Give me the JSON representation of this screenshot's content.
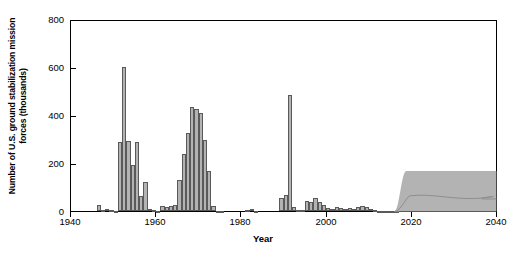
{
  "chart_data": {
    "type": "bar",
    "title": "",
    "xlabel": "Year",
    "ylabel": "Number of U.S. ground stabilization mission forces (thousands)",
    "xlim": [
      1940,
      2040
    ],
    "ylim": [
      0,
      800
    ],
    "xticks": [
      1940,
      1960,
      1980,
      2000,
      2020,
      2040
    ],
    "yticks": [
      0,
      200,
      400,
      600,
      800
    ],
    "grid": false,
    "legend": "none",
    "bar_color": "#b3b3b3",
    "bar_edge_color": "#5a5a5a",
    "band_color": "#b3b3b3",
    "categories": [
      1940,
      1941,
      1942,
      1943,
      1944,
      1945,
      1946,
      1947,
      1948,
      1949,
      1950,
      1951,
      1952,
      1953,
      1954,
      1955,
      1956,
      1957,
      1958,
      1959,
      1960,
      1961,
      1962,
      1963,
      1964,
      1965,
      1966,
      1967,
      1968,
      1969,
      1970,
      1971,
      1972,
      1973,
      1974,
      1975,
      1976,
      1977,
      1978,
      1979,
      1980,
      1981,
      1982,
      1983,
      1984,
      1985,
      1986,
      1987,
      1988,
      1989,
      1990,
      1991,
      1992,
      1993,
      1994,
      1995,
      1996,
      1997,
      1998,
      1999,
      2000,
      2001,
      2002,
      2003,
      2004,
      2005,
      2006,
      2007,
      2008,
      2009,
      2010,
      2011,
      2012,
      2013,
      2014,
      2015,
      2016
    ],
    "values": [
      0,
      0,
      0,
      0,
      0,
      0,
      28,
      6,
      9,
      4,
      2,
      290,
      605,
      295,
      195,
      290,
      65,
      125,
      10,
      6,
      3,
      22,
      20,
      22,
      25,
      130,
      240,
      330,
      440,
      430,
      415,
      300,
      170,
      22,
      3,
      2,
      0,
      0,
      0,
      0,
      0,
      4,
      12,
      3,
      0,
      0,
      0,
      0,
      0,
      58,
      70,
      490,
      18,
      8,
      4,
      45,
      40,
      55,
      38,
      25,
      14,
      12,
      20,
      14,
      12,
      14,
      10,
      20,
      22,
      18,
      10,
      6,
      3,
      2,
      2,
      2,
      2
    ],
    "series_notes": [
      {
        "name": "Korean War peak",
        "year": 1952,
        "value": 605
      },
      {
        "name": "Vietnam War peak",
        "year": 1968,
        "value": 440
      },
      {
        "name": "Gulf War peak",
        "year": 1991,
        "value": 490
      }
    ],
    "projection_band": {
      "label": "",
      "start_year": 2016,
      "ramp_end_year": 2020,
      "end_year": 2040,
      "upper_value": 170,
      "lower_value": 0,
      "inner_line_value": 65
    }
  },
  "axes": {
    "y_tick_labels": [
      "800",
      "600",
      "400",
      "200",
      "0"
    ],
    "x_tick_labels": [
      "1940",
      "1960",
      "1980",
      "2000",
      "2020",
      "2040"
    ],
    "y_axis_title": "Number of U.S. ground stabilization mission forces (thousands)",
    "x_axis_title": "Year"
  }
}
